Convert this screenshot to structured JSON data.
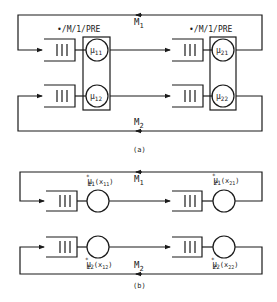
{
  "diagram_a": {
    "caption": "(a)",
    "station_label_left": "•/M/1/PRE",
    "station_label_right": "•/M/1/PRE",
    "top_class": {
      "name": "M",
      "sub": "1"
    },
    "bottom_class": {
      "name": "M",
      "sub": "2"
    },
    "servers": [
      {
        "id": "mu11",
        "mu": "μ",
        "sub": "11"
      },
      {
        "id": "mu12",
        "mu": "μ",
        "sub": "12"
      },
      {
        "id": "mu21",
        "mu": "μ",
        "sub": "21"
      },
      {
        "id": "mu22",
        "mu": "μ",
        "sub": "22"
      }
    ]
  },
  "diagram_b": {
    "caption": "(b)",
    "top_class": {
      "name": "M",
      "sub": "1"
    },
    "bottom_class": {
      "name": "M",
      "sub": "2"
    },
    "servers": [
      {
        "id": "mu11",
        "mu": "μ",
        "sup": "*",
        "sub": "11",
        "arg": "(x",
        "argsub": "11",
        "close": ")"
      },
      {
        "id": "mu12",
        "mu": "μ",
        "sup": "*",
        "sub": "12",
        "arg": "(x",
        "argsub": "12",
        "close": ")"
      },
      {
        "id": "mu21",
        "mu": "μ",
        "sup": "*",
        "sub": "21",
        "arg": "(x",
        "argsub": "21",
        "close": ")"
      },
      {
        "id": "mu22",
        "mu": "μ",
        "sup": "*",
        "sub": "22",
        "arg": "(x",
        "argsub": "22",
        "close": ")"
      }
    ]
  },
  "colors": {
    "line": "#1a1a1a",
    "background": "#ffffff"
  }
}
